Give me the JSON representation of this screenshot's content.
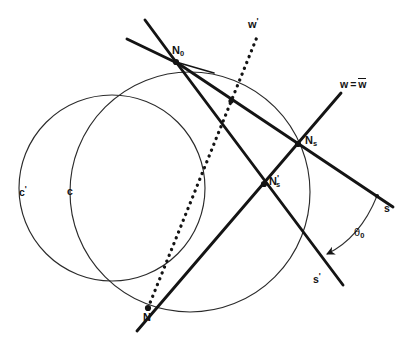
{
  "figure": {
    "domain": "geometry-diagram",
    "background_color": "#ffffff",
    "stroke_color": "#141414",
    "thin_stroke_color": "#2a2a2a",
    "labels": {
      "w_prime": "w",
      "w_prime_mark": "'",
      "w_equals_wbar_lhs": "w",
      "w_equals_wbar_eq": "=",
      "w_equals_wbar_rhs": "w",
      "N_zero": "N",
      "N_zero_sub": "0",
      "N_s": "N",
      "N_s_sub": "s",
      "N_s_prime": "N",
      "N_s_prime_mark": "'",
      "N_s_prime_sub": "s",
      "N": "N",
      "c_prime": "c",
      "c_prime_mark": "'",
      "c": "c",
      "s": "s",
      "s_prime": "s",
      "s_prime_mark": "'",
      "theta": "θ",
      "theta_sub": "0"
    },
    "points": {
      "N_zero": {
        "x": 176,
        "y": 62
      },
      "N": {
        "x": 148,
        "y": 308
      },
      "N_s": {
        "x": 298,
        "y": 144
      },
      "N_s_prime": {
        "x": 264,
        "y": 184
      },
      "dot_on_w_eq_wbar": {
        "x": 231,
        "y": 101
      },
      "dot_on_s_line": {
        "x": 377,
        "y": 196
      }
    },
    "circles": [
      {
        "name": "c-prime",
        "cx": 112,
        "cy": 188,
        "r": 93,
        "label": "c'"
      },
      {
        "name": "c",
        "cx": 190,
        "cy": 192,
        "r": 120,
        "label": "c"
      }
    ],
    "lines": [
      {
        "name": "w-prime-dotted",
        "style": "dotted",
        "from": {
          "x": 148,
          "y": 308
        },
        "to": {
          "x": 256,
          "y": 38
        }
      },
      {
        "name": "w-equals-wbar",
        "style": "solid",
        "from": {
          "x": 176,
          "y": 62
        },
        "to": {
          "x": 392,
          "y": 206
        }
      },
      {
        "name": "s-ray",
        "style": "solid",
        "from": {
          "x": 298,
          "y": 144
        },
        "to": {
          "x": 340,
          "y": 94
        }
      },
      {
        "name": "s-prime-ray",
        "style": "solid",
        "from": {
          "x": 176,
          "y": 62
        },
        "to": {
          "x": 342,
          "y": 284
        }
      },
      {
        "name": "N-to-Ns",
        "style": "solid",
        "from": {
          "x": 138,
          "y": 330
        },
        "to": {
          "x": 340,
          "y": 94
        }
      },
      {
        "name": "upper-left-ray-steep",
        "style": "solid",
        "from": {
          "x": 176,
          "y": 62
        },
        "to": {
          "x": 146,
          "y": 21
        }
      },
      {
        "name": "upper-left-ray-shallow",
        "style": "solid",
        "from": {
          "x": 176,
          "y": 62
        },
        "to": {
          "x": 128,
          "y": 40
        }
      }
    ],
    "angle_arc": {
      "name": "theta-0-arc",
      "from_point": {
        "x": 377,
        "y": 196
      },
      "to_point": {
        "x": 322,
        "y": 258
      },
      "label": "θ0"
    }
  },
  "label_positions": {
    "w_prime": {
      "left": 248,
      "top": 18
    },
    "w_equals_wbar": {
      "left": 341,
      "top": 79
    },
    "N_zero": {
      "left": 173,
      "top": 46
    },
    "N_s": {
      "left": 305,
      "top": 136
    },
    "N_s_prime": {
      "left": 269,
      "top": 175
    },
    "N": {
      "left": 144,
      "top": 313
    },
    "c_prime": {
      "left": 19,
      "top": 186
    },
    "c": {
      "left": 67,
      "top": 187
    },
    "s": {
      "left": 384,
      "top": 203
    },
    "s_prime": {
      "left": 313,
      "top": 274
    },
    "theta": {
      "left": 355,
      "top": 228
    }
  }
}
